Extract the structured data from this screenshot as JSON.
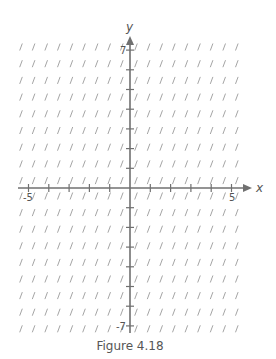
{
  "figure": {
    "caption": "Figure 4.18",
    "x_axis_label": "x",
    "y_axis_label": "y",
    "tick_labels": {
      "x_min": "-5",
      "x_max": "5",
      "y_max": "7",
      "y_min": "-7"
    },
    "colors": {
      "axis": "#707070",
      "slope_mark": "#9a9a9a",
      "text": "#555555"
    }
  },
  "slope_field": {
    "columns": 18,
    "rows": 18,
    "mark_description": "short uniform steep positive-slope segments",
    "x_ticks": [
      -5,
      -4,
      -3,
      -2,
      -1,
      1,
      2,
      3,
      4,
      5
    ],
    "y_ticks": [
      -7,
      -6,
      -5,
      -4,
      -3,
      -2,
      -1,
      1,
      2,
      3,
      4,
      5,
      6,
      7
    ]
  }
}
